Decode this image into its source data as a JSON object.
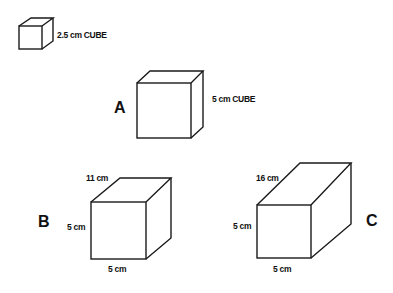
{
  "diagram": {
    "reference_cube": {
      "label": "2.5 cm CUBE"
    },
    "shapes": [
      {
        "id": "A",
        "letter": "A",
        "label": "5 cm CUBE"
      },
      {
        "id": "B",
        "letter": "B",
        "depth": "11 cm",
        "height": "5 cm",
        "width": "5 cm"
      },
      {
        "id": "C",
        "letter": "C",
        "depth": "16 cm",
        "height": "5 cm",
        "width": "5 cm"
      }
    ]
  }
}
